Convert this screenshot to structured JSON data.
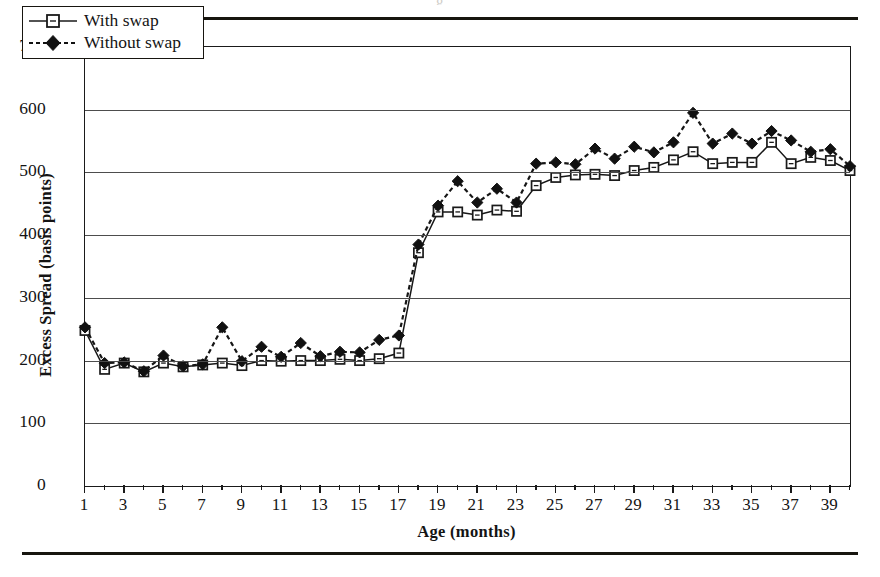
{
  "figure": {
    "caption_ghost": "g",
    "rule_color": "#17150f"
  },
  "legend": {
    "position": "top-left-inside",
    "entries": [
      {
        "label": "With swap",
        "marker": "open-square",
        "line": "solid",
        "color": "#1a1a1a"
      },
      {
        "label": "Without swap",
        "marker": "filled-diamond",
        "line": "dashed",
        "color": "#111111"
      }
    ]
  },
  "chart_data": {
    "type": "line",
    "title": "",
    "subtitle": "",
    "xlabel": "Age (months)",
    "ylabel": "Excess Spread (basis points)",
    "xlim": [
      1,
      40
    ],
    "ylim": [
      0,
      700
    ],
    "ytick_labels": [
      "0",
      "100",
      "200",
      "300",
      "400",
      "500",
      "600",
      "700"
    ],
    "ytick_values": [
      0,
      100,
      200,
      300,
      400,
      500,
      600,
      700
    ],
    "xtick_labels": [
      "1",
      "3",
      "5",
      "7",
      "9",
      "11",
      "13",
      "15",
      "17",
      "19",
      "21",
      "23",
      "25",
      "27",
      "29",
      "31",
      "33",
      "35",
      "37",
      "39"
    ],
    "xtick_values": [
      1,
      3,
      5,
      7,
      9,
      11,
      13,
      15,
      17,
      19,
      21,
      23,
      25,
      27,
      29,
      31,
      33,
      35,
      37,
      39
    ],
    "grid": "horizontal",
    "legend_position": "top-left-inside",
    "x": [
      1,
      2,
      3,
      4,
      5,
      6,
      7,
      8,
      9,
      10,
      11,
      12,
      13,
      14,
      15,
      16,
      17,
      18,
      19,
      20,
      21,
      22,
      23,
      24,
      25,
      26,
      27,
      28,
      29,
      30,
      31,
      32,
      33,
      34,
      35,
      36,
      37,
      38,
      39,
      40
    ],
    "series": [
      {
        "name": "With swap",
        "marker": "open-square",
        "line": "solid",
        "values": [
          248,
          186,
          196,
          182,
          196,
          190,
          193,
          196,
          192,
          200,
          199,
          200,
          200,
          202,
          200,
          203,
          212,
          372,
          437,
          437,
          432,
          440,
          438,
          479,
          492,
          496,
          497,
          495,
          503,
          508,
          520,
          533,
          514,
          516,
          516,
          548,
          514,
          524,
          519,
          503
        ]
      },
      {
        "name": "Without swap",
        "marker": "filled-diamond",
        "line": "dashed",
        "values": [
          253,
          196,
          197,
          183,
          208,
          191,
          194,
          253,
          199,
          222,
          206,
          228,
          207,
          214,
          213,
          233,
          240,
          385,
          447,
          486,
          452,
          474,
          452,
          514,
          516,
          513,
          538,
          522,
          541,
          532,
          548,
          595,
          546,
          562,
          546,
          566,
          551,
          533,
          537,
          510
        ]
      }
    ]
  }
}
